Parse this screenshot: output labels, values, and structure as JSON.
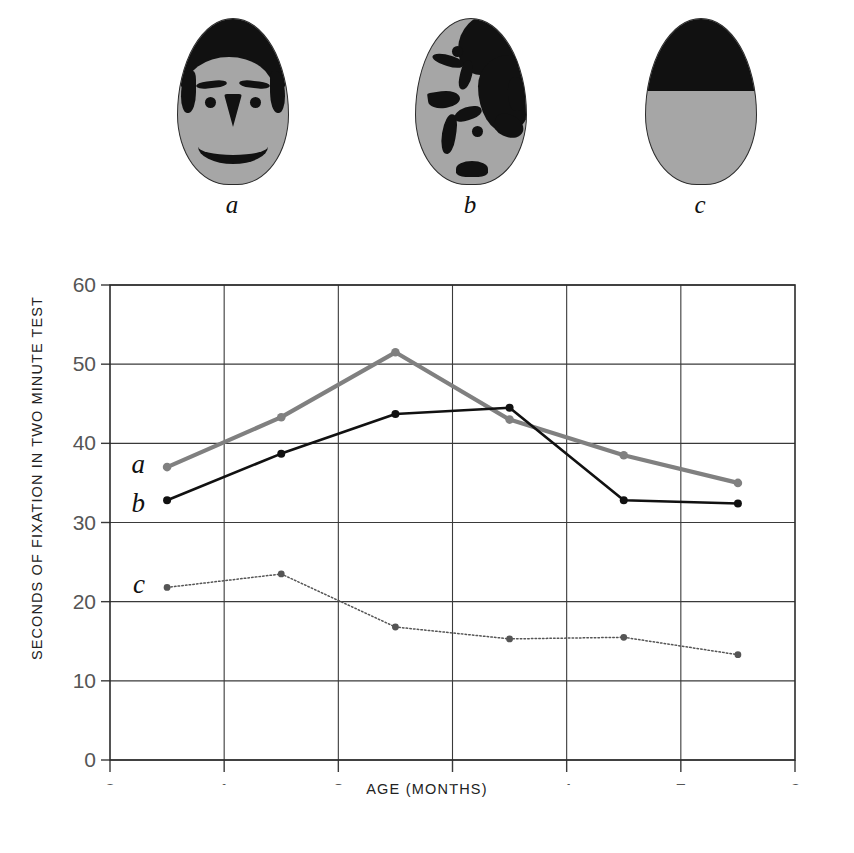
{
  "stimuli": [
    {
      "caption": "a",
      "name": "schematic-face-stimulus",
      "desc": "schematic face"
    },
    {
      "caption": "b",
      "name": "scrambled-face-stimulus",
      "desc": "scrambled face features"
    },
    {
      "caption": "c",
      "name": "control-stimulus",
      "desc": "control, top half black"
    }
  ],
  "chart_data": {
    "type": "line",
    "title": "",
    "xlabel": "AGE (MONTHS)",
    "ylabel": "SECONDS OF FIXATION IN TWO MINUTE TEST",
    "x": [
      0.5,
      1.5,
      2.5,
      3.5,
      4.5,
      5.5
    ],
    "xlim": [
      0,
      6
    ],
    "ylim": [
      0,
      60
    ],
    "xticks": [
      "0",
      "1",
      "2",
      "3",
      "4",
      "5",
      "6"
    ],
    "yticks": [
      "0",
      "10",
      "20",
      "30",
      "40",
      "50",
      "60"
    ],
    "grid": true,
    "legend_position": "inline-left",
    "series": [
      {
        "name": "a",
        "label": "a",
        "color": "#808080",
        "style": "solid",
        "values": [
          37.0,
          43.3,
          51.5,
          43.0,
          38.5,
          35.0
        ]
      },
      {
        "name": "b",
        "label": "b",
        "color": "#111111",
        "style": "solid",
        "values": [
          32.8,
          38.7,
          43.7,
          44.5,
          32.8,
          32.4
        ]
      },
      {
        "name": "c",
        "label": "c",
        "color": "#555555",
        "style": "dotted",
        "values": [
          21.8,
          23.5,
          16.8,
          15.3,
          15.5,
          13.3
        ]
      }
    ]
  },
  "colors": {
    "series_a": "#808080",
    "series_b": "#111111",
    "series_c": "#555555",
    "stimulus_skin": "#a6a6a6",
    "stimulus_ink": "#111111",
    "axis": "#333333"
  }
}
